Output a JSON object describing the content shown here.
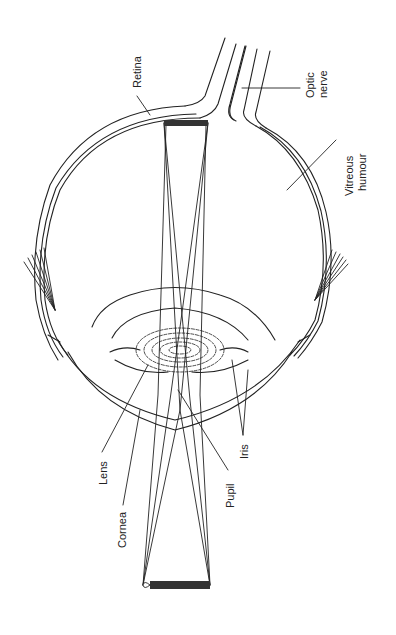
{
  "diagram": {
    "labels": {
      "retina": "Retina",
      "optic_nerve_1": "Optic",
      "optic_nerve_2": "nerve",
      "vitreous_1": "Vitreous",
      "vitreous_2": "humour",
      "lens": "Lens",
      "cornea": "Cornea",
      "pupil": "Pupil",
      "iris": "Iris"
    },
    "colors": {
      "line": "#222222",
      "fill_dark": "#333333",
      "background": "#ffffff"
    }
  }
}
